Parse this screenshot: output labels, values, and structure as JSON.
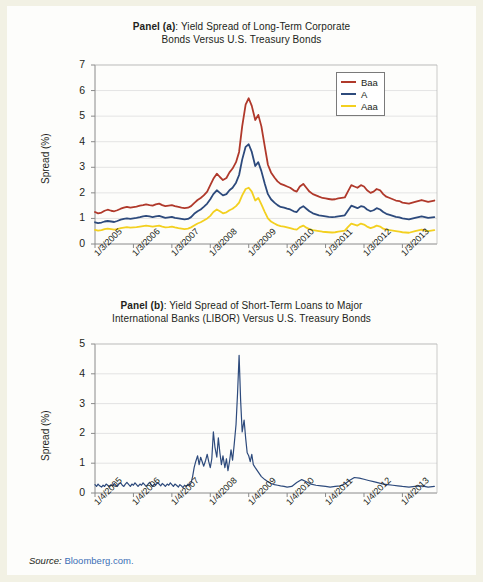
{
  "figure": {
    "source_prefix": "Source:",
    "source_link": "Bloomberg.com."
  },
  "panel_a": {
    "title_bold": "Panel (a)",
    "title_line1": ": Yield Spread of Long-Term Corporate",
    "title_line2": "Bonds Versus U.S. Treasury Bonds",
    "ylabel": "Spread (%)",
    "legend": [
      {
        "label": "Baa",
        "color": "#b0392b"
      },
      {
        "label": "A",
        "color": "#2d4a7c"
      },
      {
        "label": "Aaa",
        "color": "#f3d020"
      }
    ]
  },
  "panel_b": {
    "title_bold": "Panel (b)",
    "title_line1": ": Yield Spread of Short-Term Loans to Major",
    "title_line2": "International Banks (LIBOR) Versus U.S. Treasury Bonds",
    "ylabel": "Spread (%)",
    "series_color": "#2d4a7c"
  },
  "chart_data": [
    {
      "type": "line",
      "title": "Panel (a): Yield Spread of Long-Term Corporate Bonds Versus U.S. Treasury Bonds",
      "xlabel": "",
      "ylabel": "Spread (%)",
      "ylim": [
        0,
        7
      ],
      "yticks": [
        0,
        1,
        2,
        3,
        4,
        5,
        6,
        7
      ],
      "grid": "horizontal",
      "legend_position": "top-right",
      "xticks": [
        "1/3/2005",
        "1/3/2006",
        "1/3/2007",
        "1/3/2008",
        "1/3/2009",
        "1/3/2010",
        "1/3/2011",
        "1/3/2012",
        "1/3/2013"
      ],
      "x": [
        2005.0,
        2005.08,
        2005.17,
        2005.25,
        2005.33,
        2005.42,
        2005.5,
        2005.58,
        2005.67,
        2005.75,
        2005.83,
        2005.92,
        2006.0,
        2006.08,
        2006.17,
        2006.25,
        2006.33,
        2006.42,
        2006.5,
        2006.58,
        2006.67,
        2006.75,
        2006.83,
        2006.92,
        2007.0,
        2007.08,
        2007.17,
        2007.25,
        2007.33,
        2007.42,
        2007.5,
        2007.58,
        2007.67,
        2007.75,
        2007.83,
        2007.92,
        2008.0,
        2008.08,
        2008.17,
        2008.25,
        2008.33,
        2008.42,
        2008.5,
        2008.58,
        2008.67,
        2008.75,
        2008.83,
        2008.92,
        2009.0,
        2009.08,
        2009.17,
        2009.25,
        2009.33,
        2009.42,
        2009.5,
        2009.58,
        2009.67,
        2009.75,
        2009.83,
        2009.92,
        2010.0,
        2010.08,
        2010.17,
        2010.25,
        2010.33,
        2010.42,
        2010.5,
        2010.58,
        2010.67,
        2010.75,
        2010.83,
        2010.92,
        2011.0,
        2011.08,
        2011.17,
        2011.25,
        2011.33,
        2011.42,
        2011.5,
        2011.58,
        2011.67,
        2011.75,
        2011.83,
        2011.92,
        2012.0,
        2012.08,
        2012.17,
        2012.25,
        2012.33,
        2012.42,
        2012.5,
        2012.58,
        2012.67,
        2012.75,
        2012.83,
        2012.92,
        2013.0,
        2013.17,
        2013.33,
        2013.5,
        2013.67,
        2013.83
      ],
      "series": [
        {
          "name": "Baa",
          "color": "#b0392b",
          "values": [
            1.25,
            1.2,
            1.23,
            1.3,
            1.34,
            1.3,
            1.28,
            1.32,
            1.38,
            1.42,
            1.45,
            1.42,
            1.44,
            1.46,
            1.5,
            1.52,
            1.55,
            1.52,
            1.5,
            1.55,
            1.58,
            1.52,
            1.48,
            1.5,
            1.52,
            1.48,
            1.45,
            1.42,
            1.4,
            1.42,
            1.48,
            1.6,
            1.72,
            1.8,
            1.9,
            2.05,
            2.3,
            2.55,
            2.75,
            2.62,
            2.5,
            2.58,
            2.8,
            2.95,
            3.2,
            3.6,
            4.6,
            5.45,
            5.7,
            5.4,
            4.85,
            5.05,
            4.6,
            3.8,
            3.1,
            2.8,
            2.6,
            2.45,
            2.35,
            2.3,
            2.25,
            2.2,
            2.1,
            2.05,
            2.25,
            2.35,
            2.2,
            2.05,
            1.95,
            1.9,
            1.85,
            1.8,
            1.78,
            1.76,
            1.74,
            1.75,
            1.78,
            1.8,
            1.82,
            2.05,
            2.3,
            2.25,
            2.2,
            2.3,
            2.25,
            2.1,
            2.0,
            2.05,
            2.15,
            2.1,
            1.95,
            1.85,
            1.8,
            1.75,
            1.7,
            1.68,
            1.62,
            1.58,
            1.65,
            1.72,
            1.65,
            1.7
          ]
        },
        {
          "name": "A",
          "color": "#2d4a7c",
          "values": [
            0.85,
            0.82,
            0.84,
            0.88,
            0.9,
            0.88,
            0.86,
            0.9,
            0.95,
            0.98,
            1.0,
            0.98,
            1.0,
            1.02,
            1.05,
            1.08,
            1.1,
            1.08,
            1.05,
            1.08,
            1.1,
            1.06,
            1.02,
            1.04,
            1.06,
            1.02,
            1.0,
            0.98,
            0.96,
            0.98,
            1.05,
            1.18,
            1.28,
            1.35,
            1.45,
            1.58,
            1.75,
            1.95,
            2.1,
            2.0,
            1.9,
            1.95,
            2.1,
            2.2,
            2.4,
            2.7,
            3.3,
            3.8,
            3.9,
            3.6,
            3.05,
            3.2,
            2.85,
            2.35,
            1.95,
            1.75,
            1.62,
            1.52,
            1.45,
            1.42,
            1.38,
            1.35,
            1.28,
            1.25,
            1.4,
            1.48,
            1.38,
            1.28,
            1.2,
            1.16,
            1.12,
            1.1,
            1.08,
            1.06,
            1.05,
            1.06,
            1.08,
            1.1,
            1.12,
            1.3,
            1.5,
            1.45,
            1.4,
            1.48,
            1.45,
            1.35,
            1.28,
            1.32,
            1.4,
            1.35,
            1.25,
            1.18,
            1.14,
            1.1,
            1.06,
            1.04,
            1.0,
            0.96,
            1.02,
            1.08,
            1.02,
            1.05
          ]
        },
        {
          "name": "Aaa",
          "color": "#f3d020",
          "values": [
            0.55,
            0.52,
            0.54,
            0.58,
            0.6,
            0.58,
            0.56,
            0.58,
            0.62,
            0.64,
            0.66,
            0.64,
            0.65,
            0.66,
            0.68,
            0.7,
            0.72,
            0.7,
            0.68,
            0.7,
            0.72,
            0.68,
            0.65,
            0.66,
            0.68,
            0.65,
            0.62,
            0.6,
            0.58,
            0.6,
            0.65,
            0.72,
            0.8,
            0.85,
            0.92,
            1.0,
            1.1,
            1.25,
            1.35,
            1.28,
            1.2,
            1.24,
            1.32,
            1.38,
            1.48,
            1.62,
            1.9,
            2.15,
            2.2,
            2.05,
            1.7,
            1.8,
            1.55,
            1.25,
            1.0,
            0.88,
            0.8,
            0.74,
            0.7,
            0.68,
            0.65,
            0.62,
            0.58,
            0.56,
            0.66,
            0.72,
            0.64,
            0.58,
            0.54,
            0.52,
            0.5,
            0.48,
            0.47,
            0.46,
            0.45,
            0.46,
            0.48,
            0.5,
            0.52,
            0.66,
            0.8,
            0.76,
            0.72,
            0.8,
            0.76,
            0.68,
            0.62,
            0.66,
            0.72,
            0.68,
            0.6,
            0.56,
            0.54,
            0.52,
            0.5,
            0.48,
            0.46,
            0.44,
            0.5,
            0.56,
            0.5,
            0.54
          ]
        }
      ]
    },
    {
      "type": "line",
      "title": "Panel (b): Yield Spread of Short-Term Loans to Major International Banks (LIBOR) Versus U.S. Treasury Bonds",
      "xlabel": "",
      "ylabel": "Spread (%)",
      "ylim": [
        0,
        5
      ],
      "yticks": [
        0,
        1,
        2,
        3,
        4,
        5
      ],
      "grid": "horizontal",
      "legend_position": "none",
      "xticks": [
        "1/4/2005",
        "1/4/2006",
        "1/4/2007",
        "1/4/2008",
        "1/4/2009",
        "1/4/2010",
        "1/4/2011",
        "1/4/2012",
        "1/4/2013"
      ],
      "series": [
        {
          "name": "LIBOR spread",
          "color": "#2d4a7c",
          "x": [
            2005.0,
            2005.04,
            2005.08,
            2005.12,
            2005.17,
            2005.21,
            2005.25,
            2005.29,
            2005.33,
            2005.38,
            2005.42,
            2005.46,
            2005.5,
            2005.54,
            2005.58,
            2005.62,
            2005.67,
            2005.71,
            2005.75,
            2005.79,
            2005.83,
            2005.88,
            2005.92,
            2005.96,
            2006.0,
            2006.04,
            2006.08,
            2006.12,
            2006.17,
            2006.21,
            2006.25,
            2006.29,
            2006.33,
            2006.38,
            2006.42,
            2006.46,
            2006.5,
            2006.54,
            2006.58,
            2006.62,
            2006.67,
            2006.71,
            2006.75,
            2006.79,
            2006.83,
            2006.88,
            2006.92,
            2006.96,
            2007.0,
            2007.04,
            2007.08,
            2007.12,
            2007.17,
            2007.21,
            2007.25,
            2007.29,
            2007.33,
            2007.38,
            2007.42,
            2007.46,
            2007.5,
            2007.54,
            2007.58,
            2007.62,
            2007.67,
            2007.71,
            2007.75,
            2007.79,
            2007.83,
            2007.88,
            2007.92,
            2007.96,
            2008.0,
            2008.04,
            2008.08,
            2008.12,
            2008.17,
            2008.21,
            2008.25,
            2008.29,
            2008.33,
            2008.38,
            2008.42,
            2008.46,
            2008.5,
            2008.54,
            2008.58,
            2008.62,
            2008.67,
            2008.71,
            2008.75,
            2008.79,
            2008.83,
            2008.88,
            2008.92,
            2008.96,
            2009.0,
            2009.04,
            2009.08,
            2009.12,
            2009.17,
            2009.25,
            2009.33,
            2009.42,
            2009.5,
            2009.58,
            2009.67,
            2009.75,
            2009.83,
            2009.92,
            2010.0,
            2010.12,
            2010.25,
            2010.38,
            2010.5,
            2010.62,
            2010.75,
            2010.88,
            2011.0,
            2011.12,
            2011.25,
            2011.38,
            2011.5,
            2011.62,
            2011.75,
            2011.88,
            2012.0,
            2012.12,
            2012.25,
            2012.38,
            2012.5,
            2012.62,
            2012.75,
            2012.88,
            2013.0,
            2013.17,
            2013.33,
            2013.5,
            2013.67,
            2013.83
          ],
          "values": [
            0.28,
            0.22,
            0.3,
            0.24,
            0.2,
            0.26,
            0.22,
            0.3,
            0.26,
            0.2,
            0.28,
            0.24,
            0.32,
            0.26,
            0.22,
            0.3,
            0.34,
            0.26,
            0.22,
            0.3,
            0.36,
            0.28,
            0.22,
            0.3,
            0.26,
            0.34,
            0.28,
            0.22,
            0.3,
            0.26,
            0.34,
            0.28,
            0.22,
            0.3,
            0.36,
            0.28,
            0.22,
            0.3,
            0.26,
            0.34,
            0.3,
            0.24,
            0.32,
            0.28,
            0.22,
            0.3,
            0.26,
            0.34,
            0.28,
            0.22,
            0.3,
            0.26,
            0.2,
            0.28,
            0.24,
            0.18,
            0.26,
            0.22,
            0.3,
            0.26,
            0.34,
            0.55,
            0.85,
            1.05,
            1.25,
            0.95,
            1.2,
            1.05,
            0.9,
            1.1,
            1.3,
            1.05,
            0.85,
            1.15,
            2.05,
            1.55,
            1.2,
            1.85,
            1.35,
            0.95,
            1.25,
            0.85,
            1.15,
            0.75,
            1.05,
            1.45,
            1.1,
            1.6,
            2.3,
            3.35,
            4.62,
            3.1,
            2.05,
            2.45,
            1.85,
            1.35,
            1.25,
            1.05,
            1.3,
            0.95,
            0.85,
            0.7,
            0.55,
            0.45,
            0.38,
            0.32,
            0.28,
            0.26,
            0.24,
            0.22,
            0.2,
            0.22,
            0.35,
            0.45,
            0.38,
            0.3,
            0.26,
            0.24,
            0.22,
            0.2,
            0.22,
            0.24,
            0.3,
            0.42,
            0.52,
            0.5,
            0.46,
            0.42,
            0.38,
            0.34,
            0.3,
            0.28,
            0.26,
            0.24,
            0.22,
            0.2,
            0.22,
            0.24,
            0.2,
            0.22
          ]
        }
      ]
    }
  ]
}
